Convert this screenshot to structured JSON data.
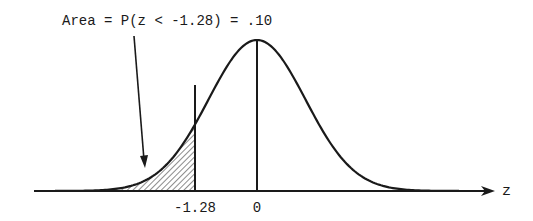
{
  "figure": {
    "type": "normal-distribution-diagram",
    "annotation": "Area = P(z < -1.28) = .10",
    "axis_label": "z",
    "ticks": [
      {
        "label": "-1.28",
        "value": -1.28
      },
      {
        "label": "0",
        "value": 0
      }
    ],
    "shaded_region": {
      "from": "-infinity",
      "to": -1.28,
      "area": 0.1,
      "pattern": "diagonal-hatch"
    },
    "colors": {
      "ink": "#1a1a1a",
      "background": "#ffffff"
    }
  }
}
